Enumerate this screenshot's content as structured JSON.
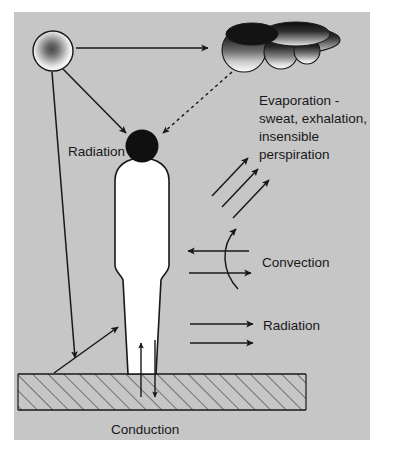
{
  "figure": {
    "panel_color": "#c6c6c6",
    "page_color": "#ffffff",
    "ink_color": "#18181a",
    "body_fill": "#ffffff",
    "head_fill": "#101010"
  },
  "labels": {
    "radiation_sun": "Radiation",
    "evaporation_line1": "Evaporation -",
    "evaporation_line2": "sweat, exhalation,",
    "evaporation_line3": "insensible",
    "evaporation_line4": "perspiration",
    "convection": "Convection",
    "radiation_body": "Radiation",
    "conduction": "Conduction"
  },
  "elements": {
    "sun": "sun-gradient-circle",
    "cloud": "cloud-gradient-shape",
    "person": "human-figure-silhouette",
    "head": "head-circle",
    "ground": "hatched-ground-layer"
  },
  "arrows": {
    "sun_to_cloud": "solid-arrow-right",
    "sun_to_head": "solid-arrow-down-right",
    "cloud_to_head": "dotted-arrow-down-left",
    "sun_to_ground": "solid-arrow-down",
    "ground_to_body": "solid-arrow-up-right",
    "evaporation": "three-diagonal-arrows-up-right",
    "convection_curve": "curved-arrow-up",
    "convection_left": "solid-arrow-left",
    "convection_right": "solid-arrow-right",
    "radiation_upper": "solid-arrow-right",
    "radiation_lower": "solid-arrow-right",
    "conduction_up": "solid-arrow-up",
    "conduction_down": "solid-arrow-down"
  }
}
